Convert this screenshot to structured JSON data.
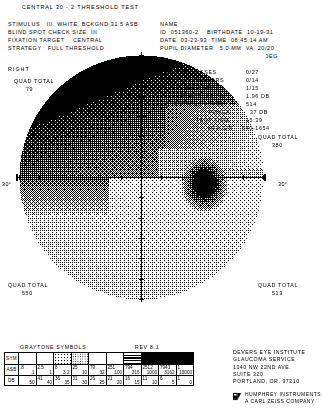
{
  "header": {
    "title": "CENTRAL 30 - 2 THRESHOLD TEST",
    "left_lines": [
      "STIMULUS   III, WHITE, BCKGND 31.5 ASB",
      "BLIND SPOT CHECK SIZE  III",
      "FIXATION TARGET    CENTRAL",
      "STRATEGY   FULL THRESHOLD"
    ],
    "name_label": "NAME",
    "right_lines": [
      "ID  051360-2    BIRTHDATE  10-19-31",
      "DATE  03-23-93  TIME  08:45:14 AM",
      "PUPIL DIAMETER   5.0 MM  VA  20/20",
      "RX USED -1.75 DS +1.50 DCX  90 DEG"
    ]
  },
  "eye": "RIGHT",
  "reliability": [
    {
      "label": "FIXATION LOSSES",
      "value": "0/27"
    },
    {
      "label": "FALSE POS ERRORS",
      "value": "0/14"
    },
    {
      "label": "FALSE NEG ERRORS",
      "value": "1/15"
    },
    {
      "label": "FLUCTUATION",
      "value": "1.96 DB"
    },
    {
      "label": "QUESTIONS ASKED",
      "value": "514"
    },
    {
      "label": "FOVEA:",
      "value": "37 DB"
    },
    {
      "label": "TEST TIME",
      "value": "15:39"
    },
    {
      "label": "HFA S/N",
      "value": "640-1654"
    }
  ],
  "quads": {
    "upper_left_label": "QUAD TOTAL",
    "upper_left_value": "79",
    "upper_right_label": "QUAD TOTAL",
    "upper_right_value": "380",
    "lower_left_label": "QUAD TOTAL",
    "lower_left_value": "550",
    "lower_right_label": "QUAD TOTAL",
    "lower_right_value": "513"
  },
  "axis": {
    "left_deg": "30°",
    "right_deg": "30°"
  },
  "legend": {
    "title": "GRAYTONE SYMBOLS",
    "rev": "REV 8.1",
    "row_labels": {
      "sym": "SYM",
      "asb": "ASB",
      "db": "DB"
    },
    "asb_high": [
      ".8",
      "2.5",
      "8",
      "25",
      "79",
      "251",
      "794",
      "2512",
      "7943",
      "1"
    ],
    "asb_low": [
      ".1",
      "1",
      "3.2",
      "10",
      "32",
      "100",
      "316",
      "1000",
      "3162",
      "10000"
    ],
    "db_high": [
      "",
      "41",
      "36",
      "31",
      "26",
      "21",
      "16",
      "11",
      "6",
      "1"
    ],
    "db_low": [
      "50",
      "40",
      "35",
      "30",
      "25",
      "20",
      "15",
      "10",
      "5",
      "0"
    ]
  },
  "address": {
    "lines": [
      "DEVERS EYE INSTITUTE",
      "GLAUCOMA SERVICE",
      "1040 NW 22ND AVE.",
      "SUITE 320",
      "PORTLAND, OR. 97210"
    ],
    "brand_line1": "HUMPHREY INSTRUMENTS",
    "brand_line2": "A CARL ZEISS COMPANY"
  },
  "chart_data": {
    "type": "heatmap",
    "eye": "RIGHT",
    "xlabel": "",
    "ylabel": "",
    "radius_deg": 30,
    "grid": false,
    "grey_levels": 10,
    "note": "darker pattern = lower sensitivity (higher ASB threshold)"
  }
}
